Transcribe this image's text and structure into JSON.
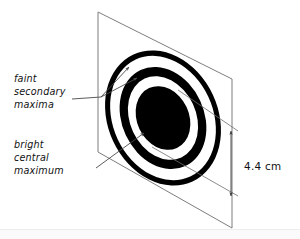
{
  "figure": {
    "background_color": "#ffffff",
    "ink_color": "#000000",
    "line_color": "#7d7d7d"
  },
  "screen": {
    "name": "viewing-screen",
    "shape": "parallelogram",
    "corners": [
      [
        98,
        12
      ],
      [
        232,
        79
      ],
      [
        232,
        228
      ],
      [
        98,
        152
      ]
    ],
    "stroke_color": "#7d7d7d"
  },
  "pattern": {
    "center": [
      163,
      118
    ],
    "rotation_deg": -25,
    "rings": [
      {
        "name": "outer-secondary-ring",
        "rx": 55,
        "ry": 70,
        "thickness": 5,
        "color": "#000000"
      },
      {
        "name": "inner-secondary-ring",
        "rx": 41,
        "ry": 53,
        "thickness": 8,
        "color": "#000000"
      },
      {
        "name": "central-maximum-disc",
        "rx": 26,
        "ry": 33,
        "color": "#000000"
      }
    ]
  },
  "labels": {
    "secondary": {
      "name": "faint-secondary-maxima-label",
      "lines": [
        "faint",
        "secondary",
        "maxima"
      ],
      "line1": "faint",
      "line2": "secondary",
      "line3": "maxima",
      "anchor": [
        14,
        80
      ],
      "arrow_count": 2
    },
    "central": {
      "name": "bright-central-maximum-label",
      "lines": [
        "bright",
        "central",
        "maximum"
      ],
      "line1": "bright",
      "line2": "central",
      "line3": "maximum",
      "anchor": [
        14,
        146
      ],
      "arrow_count": 1
    }
  },
  "dimension": {
    "name": "central-maximum-width",
    "value": "4.4",
    "unit": "cm",
    "text": "4.4 cm",
    "orientation": "vertical",
    "arrowheads": "double",
    "x": 246,
    "y_top": 131,
    "y_bottom": 196
  }
}
